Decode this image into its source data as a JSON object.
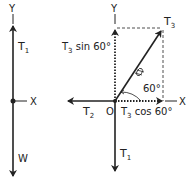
{
  "colors": {
    "ink": "#222222",
    "background": "#ffffff"
  },
  "left_diagram": {
    "axis_y_label": "Y",
    "axis_x_label": "X",
    "force_up": {
      "label": "T",
      "subscript": "1"
    },
    "force_down": {
      "label": "W"
    }
  },
  "right_diagram": {
    "axis_y_label": "Y",
    "axis_x_label": "X",
    "origin_label": "O",
    "force_t1": {
      "label": "T",
      "subscript": "1"
    },
    "force_t2": {
      "label": "T",
      "subscript": "2"
    },
    "force_t3": {
      "label": "T",
      "subscript": "3"
    },
    "component_vertical": {
      "label": "T",
      "subscript": "3",
      "suffix": " sin 60°"
    },
    "component_horizontal": {
      "label": "T",
      "subscript": "3",
      "suffix": " cos 60°"
    },
    "angle_label": "60°"
  }
}
